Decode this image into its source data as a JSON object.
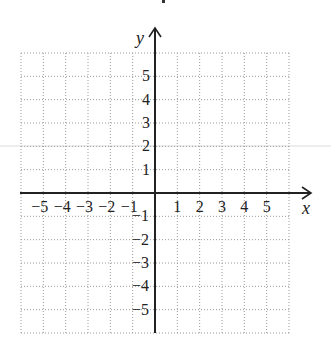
{
  "chart_data": {
    "type": "coordinate-grid",
    "title": "",
    "xlabel": "x",
    "ylabel": "y",
    "xlim": [
      -6,
      6
    ],
    "ylim": [
      -6,
      6
    ],
    "grid": "dotted",
    "x_tick_labels": [
      "−5",
      "−4",
      "−3",
      "−2",
      "−1",
      "1",
      "2",
      "3",
      "4",
      "5"
    ],
    "x_tick_values": [
      -5,
      -4,
      -3,
      -2,
      -1,
      1,
      2,
      3,
      4,
      5
    ],
    "y_tick_labels": [
      "5",
      "4",
      "3",
      "2",
      "1",
      "−1",
      "−2",
      "−3",
      "−4",
      "−5"
    ],
    "y_tick_values": [
      5,
      4,
      3,
      2,
      1,
      -1,
      -2,
      -3,
      -4,
      -5
    ],
    "series": []
  },
  "colors": {
    "axis": "#222222",
    "grid": "#9a9a9a",
    "artifact_line": "#d6d6d6",
    "background": "#ffffff"
  },
  "labels": {
    "x_axis": "x",
    "y_axis": "y"
  }
}
